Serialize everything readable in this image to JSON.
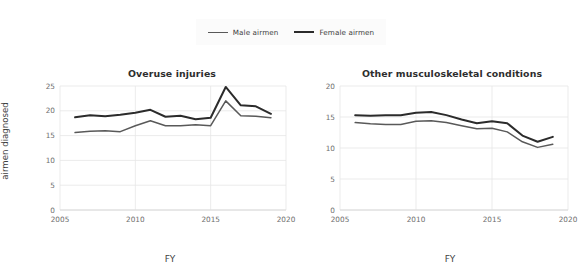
{
  "legend": {
    "position": "top-center",
    "entries": [
      {
        "label": "Male airmen",
        "color": "#595959",
        "icon": "line-swatch-icon"
      },
      {
        "label": "Female airmen",
        "color": "#2b2b2b",
        "icon": "line-swatch-icon"
      }
    ]
  },
  "axes": {
    "ylabel_line1": "Percentage of",
    "ylabel_line2": "airmen diagnosed",
    "xlabel": "FY"
  },
  "chart_data": [
    {
      "type": "line",
      "title": "Overuse injuries",
      "xlabel": "FY",
      "ylabel": "Percentage of airmen diagnosed",
      "xlim": [
        2005,
        2020
      ],
      "ylim": [
        0,
        25
      ],
      "xticks": [
        2005,
        2010,
        2015,
        2020
      ],
      "yticks": [
        0,
        5,
        10,
        15,
        20,
        25
      ],
      "grid": true,
      "legend": "top-center",
      "x": [
        2006,
        2007,
        2008,
        2009,
        2010,
        2011,
        2012,
        2013,
        2014,
        2015,
        2016,
        2017,
        2018,
        2019
      ],
      "series": [
        {
          "name": "Male airmen",
          "color": "#595959",
          "values": [
            15.6,
            15.9,
            16.0,
            15.8,
            17.0,
            18.0,
            17.0,
            17.0,
            17.2,
            17.0,
            22.0,
            19.0,
            18.9,
            18.6
          ]
        },
        {
          "name": "Female airmen",
          "color": "#2b2b2b",
          "values": [
            18.7,
            19.1,
            18.9,
            19.2,
            19.6,
            20.2,
            18.8,
            19.0,
            18.3,
            18.6,
            24.8,
            21.1,
            20.9,
            19.4
          ]
        }
      ]
    },
    {
      "type": "line",
      "title": "Other musculoskeletal conditions",
      "xlabel": "FY",
      "ylabel": "Percentage of airmen diagnosed",
      "xlim": [
        2005,
        2020
      ],
      "ylim": [
        0,
        20
      ],
      "xticks": [
        2005,
        2010,
        2015,
        2020
      ],
      "yticks": [
        0,
        5,
        10,
        15,
        20
      ],
      "grid": true,
      "legend": "top-center",
      "x": [
        2006,
        2007,
        2008,
        2009,
        2010,
        2011,
        2012,
        2013,
        2014,
        2015,
        2016,
        2017,
        2018,
        2019
      ],
      "series": [
        {
          "name": "Male airmen",
          "color": "#595959",
          "values": [
            14.1,
            13.9,
            13.8,
            13.8,
            14.3,
            14.4,
            14.1,
            13.6,
            13.1,
            13.2,
            12.6,
            11.0,
            10.1,
            10.6
          ]
        },
        {
          "name": "Female airmen",
          "color": "#2b2b2b",
          "values": [
            15.3,
            15.2,
            15.3,
            15.3,
            15.7,
            15.8,
            15.3,
            14.6,
            14.0,
            14.3,
            14.0,
            12.0,
            11.0,
            11.8
          ]
        }
      ]
    }
  ]
}
